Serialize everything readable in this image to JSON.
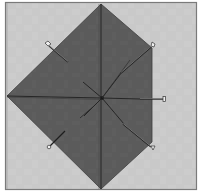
{
  "image": {
    "description": "Folded fabric/paper square pinned to a board forming a pentagon shape with fold lines radiating from the center",
    "colors": {
      "background": "#ffffff",
      "board": "#c8c8c8",
      "board_border": "#6a6a6a",
      "fabric": "#5a5a5a",
      "fold_line": "#2a2a2a",
      "pin_shaft": "#1e1e1e",
      "pin_highlight": "#e8e8e8"
    },
    "shape": {
      "vertices": [
        [
          101,
          4
        ],
        [
          152,
          48
        ],
        [
          152,
          142
        ],
        [
          101,
          189
        ],
        [
          7,
          96
        ]
      ],
      "center": [
        102,
        98
      ]
    },
    "pins": [
      {
        "name": "upper-left",
        "head": [
          46,
          44
        ],
        "tip": [
          68,
          62
        ]
      },
      {
        "name": "upper-right",
        "head": [
          153,
          44
        ],
        "tip": [
          122,
          72
        ]
      },
      {
        "name": "right",
        "head": [
          165,
          99
        ],
        "tip": [
          140,
          99
        ]
      },
      {
        "name": "lower-right",
        "head": [
          152,
          149
        ],
        "tip": [
          123,
          124
        ]
      },
      {
        "name": "lower-left",
        "head": [
          49,
          147
        ],
        "tip": [
          65,
          131
        ]
      }
    ]
  }
}
